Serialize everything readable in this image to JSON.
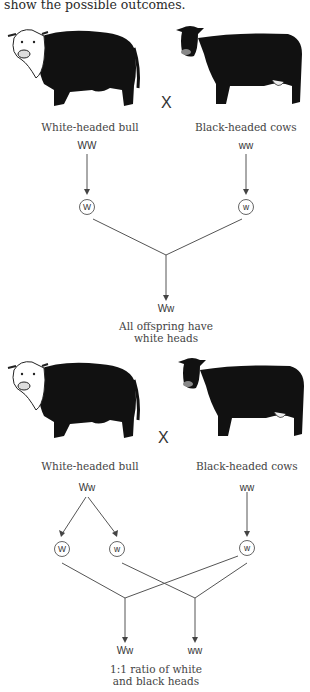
{
  "intro_text": "show the possible outcomes.",
  "cross_symbol": "X",
  "cross1": {
    "bull_label": "White-headed bull",
    "cow_label": "Black-headed cows",
    "bull_genotype": "WW",
    "cow_genotype": "ww",
    "bull_gametes": [
      "W"
    ],
    "cow_gametes": [
      "w"
    ],
    "offspring_genotypes": [
      "Ww"
    ],
    "caption_line1": "All offspring have",
    "caption_line2": "white heads"
  },
  "cross2": {
    "bull_label": "White-headed bull",
    "cow_label": "Black-headed cows",
    "bull_genotype": "Ww",
    "cow_genotype": "ww",
    "bull_gametes": [
      "W",
      "w"
    ],
    "cow_gametes": [
      "w"
    ],
    "offspring_genotypes": [
      "Ww",
      "ww"
    ],
    "caption_line1": "1:1 ratio of white",
    "caption_line2": "and black heads"
  },
  "icons": {
    "bull": "hereford-bull-illustration",
    "cow": "black-cow-illustration"
  }
}
